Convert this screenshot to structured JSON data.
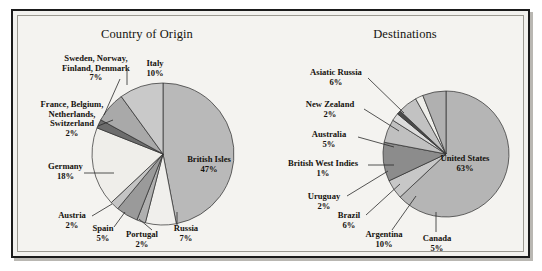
{
  "figure": {
    "frame_color": "#1b1b1b",
    "background": "#f4f3f0"
  },
  "chart_data": [
    {
      "type": "pie",
      "title": "Country of Origin",
      "categories": [
        "British Isles",
        "Russia",
        "Portugal",
        "Spain",
        "Austria",
        "Germany",
        "France, Belgium, Netherlands, Switzerland",
        "Sweden, Norway, Finland, Denmark",
        "Italy"
      ],
      "values": [
        47,
        7,
        2,
        5,
        2,
        18,
        2,
        7,
        10
      ],
      "labels": [
        "47%",
        "7%",
        "2%",
        "5%",
        "2%",
        "18%",
        "2%",
        "7%",
        "10%"
      ],
      "colors": [
        "#b9b9b9",
        "#f0efec",
        "#b0b0b0",
        "#9a9a9a",
        "#c4c4c4",
        "#efeeea",
        "#6d6d6d",
        "#a9a9a9",
        "#c9c9c9"
      ],
      "start_angle_deg": 0,
      "legend": "none",
      "label_placement": "callout"
    },
    {
      "type": "pie",
      "title": "Destinations",
      "categories": [
        "United States",
        "Canada",
        "Argentina",
        "Brazil",
        "Uruguay",
        "British West Indies",
        "Australia",
        "New Zealand",
        "Asiatic Russia"
      ],
      "values": [
        63,
        5,
        10,
        6,
        2,
        1,
        5,
        2,
        6
      ],
      "labels": [
        "63%",
        "5%",
        "10%",
        "6%",
        "2%",
        "1%",
        "5%",
        "2%",
        "6%"
      ],
      "colors": [
        "#b5b5b5",
        "#c7c7c7",
        "#8c8c8c",
        "#c0c0c0",
        "#dcdcdc",
        "#4a4a4a",
        "#c2c2c2",
        "#eeeeea",
        "#b0b0b0"
      ],
      "start_angle_deg": 0,
      "legend": "none",
      "label_placement": "callout"
    }
  ],
  "origin": {
    "title": "Country of Origin",
    "labels": [
      {
        "name": "british-isles",
        "text": "British Isles",
        "pct": "47%"
      },
      {
        "name": "italy",
        "text": "Italy",
        "pct": "10%"
      },
      {
        "name": "sweden-norway-finland-denmark",
        "line1": "Sweden, Norway,",
        "line2": "Finland, Denmark",
        "pct": "7%"
      },
      {
        "name": "france-belgium-netherlands-switzerland",
        "line1": "France, Belgium,",
        "line2": "Netherlands,",
        "line3": "Switzerland",
        "pct": "2%"
      },
      {
        "name": "germany",
        "text": "Germany",
        "pct": "18%"
      },
      {
        "name": "austria",
        "text": "Austria",
        "pct": "2%"
      },
      {
        "name": "spain",
        "text": "Spain",
        "pct": "5%"
      },
      {
        "name": "portugal",
        "text": "Portugal",
        "pct": "2%"
      },
      {
        "name": "russia",
        "text": "Russia",
        "pct": "7%"
      }
    ]
  },
  "destinations": {
    "title": "Destinations",
    "labels": [
      {
        "name": "united-states",
        "text": "United States",
        "pct": "63%"
      },
      {
        "name": "asiatic-russia",
        "text": "Asiatic Russia",
        "pct": "6%"
      },
      {
        "name": "new-zealand",
        "text": "New Zealand",
        "pct": "2%"
      },
      {
        "name": "australia",
        "text": "Australia",
        "pct": "5%"
      },
      {
        "name": "british-west-indies",
        "text": "British West Indies",
        "pct": "1%"
      },
      {
        "name": "uruguay",
        "text": "Uruguay",
        "pct": "2%"
      },
      {
        "name": "brazil",
        "text": "Brazil",
        "pct": "6%"
      },
      {
        "name": "argentina",
        "text": "Argentina",
        "pct": "10%"
      },
      {
        "name": "canada",
        "text": "Canada",
        "pct": "5%"
      }
    ]
  }
}
